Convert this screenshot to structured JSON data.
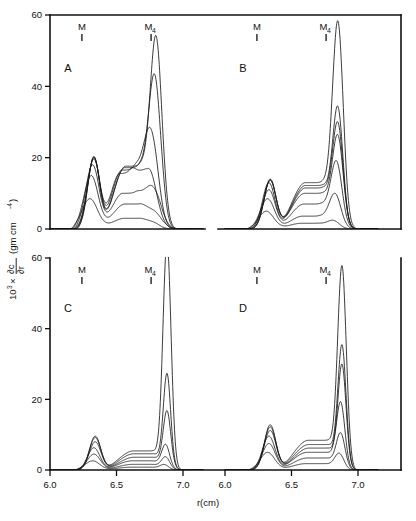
{
  "figure": {
    "xlabel": "r(cm)",
    "ylabel_prefix": "10",
    "ylabel_exponent": "3",
    "ylabel_times": "×",
    "ylabel_frac_num": "∂c",
    "ylabel_frac_den": "∂r",
    "ylabel_units_open": "(gm cm",
    "ylabel_units_exp": "-4",
    "ylabel_units_close": ")",
    "x_ticks": [
      "6.0",
      "6.5",
      "7.0"
    ],
    "x_tick_values": [
      6.0,
      6.5,
      7.0
    ],
    "y_ticks": [
      "0",
      "20",
      "40",
      "60"
    ],
    "y_tick_values": [
      0,
      20,
      40,
      60
    ],
    "marker_m_label": "M",
    "marker_m4_label": "M",
    "marker_m4_sub": "4",
    "marker_m_x": 6.24,
    "marker_m4_x": 6.76
  },
  "chart_data": {
    "type": "line",
    "title": "",
    "xlabel": "r(cm)",
    "ylabel": "10^3 × ∂c/∂r (gm cm^-4)",
    "xlim": [
      6.0,
      7.15
    ],
    "ylim": [
      0,
      60
    ],
    "grid": false,
    "legend": "none",
    "annotations": [
      {
        "text": "M",
        "x": 6.24,
        "note": "monomer marker"
      },
      {
        "text": "M4",
        "x": 6.76,
        "note": "tetramer marker"
      }
    ],
    "panels": [
      {
        "label": "A",
        "ylim": [
          0,
          60
        ],
        "series": [
          {
            "name": "A1",
            "peak_m": 8.5,
            "peak_m4": 0.9,
            "valley": 3.0,
            "m_x": 6.3,
            "m4_x": 6.8,
            "edge_left": 6.14,
            "edge_right": 6.92,
            "broad": 0.06,
            "broad4": 0.045
          },
          {
            "name": "A2",
            "peak_m": 15.0,
            "peak_m4": 3.0,
            "valley": 7.0,
            "m_x": 6.31,
            "m4_x": 6.81,
            "edge_left": 6.15,
            "edge_right": 6.98,
            "broad": 0.055,
            "broad4": 0.05
          },
          {
            "name": "A3",
            "peak_m": 18.0,
            "peak_m4": 11.0,
            "valley": 10.0,
            "m_x": 6.32,
            "m4_x": 6.78,
            "edge_left": 6.16,
            "edge_right": 7.02,
            "broad": 0.052,
            "broad4": 0.055
          },
          {
            "name": "A4",
            "peak_m": 19.6,
            "peak_m4": 17.0,
            "valley": 15.5,
            "m_x": 6.33,
            "m4_x": 6.74,
            "edge_left": 6.16,
            "edge_right": 7.04,
            "broad": 0.05,
            "broad4": 0.06
          },
          {
            "name": "A5",
            "peak_m": 20.0,
            "peak_m4": 27.0,
            "valley": 16.5,
            "m_x": 6.33,
            "m4_x": 6.76,
            "edge_left": 6.17,
            "edge_right": 7.06,
            "broad": 0.048,
            "broad4": 0.052
          },
          {
            "name": "A6",
            "peak_m": 20.2,
            "peak_m4": 40.0,
            "valley": 17.2,
            "m_x": 6.33,
            "m4_x": 6.79,
            "edge_left": 6.17,
            "edge_right": 7.08,
            "broad": 0.046,
            "broad4": 0.046
          },
          {
            "name": "A7",
            "peak_m": 20.3,
            "peak_m4": 50.0,
            "valley": 17.6,
            "m_x": 6.33,
            "m4_x": 6.8,
            "edge_left": 6.18,
            "edge_right": 7.1,
            "broad": 0.045,
            "broad4": 0.044
          }
        ]
      },
      {
        "label": "B",
        "ylim": [
          0,
          60
        ],
        "series": [
          {
            "name": "B1",
            "peak_m": 5.0,
            "peak_m4": 2.0,
            "valley": 1.6,
            "m_x": 6.31,
            "m4_x": 6.82,
            "edge_left": 6.14,
            "edge_right": 6.96,
            "broad": 0.058,
            "broad4": 0.045
          },
          {
            "name": "B2",
            "peak_m": 8.5,
            "peak_m4": 9.0,
            "valley": 3.6,
            "m_x": 6.32,
            "m4_x": 6.83,
            "edge_left": 6.15,
            "edge_right": 7.02,
            "broad": 0.054,
            "broad4": 0.044
          },
          {
            "name": "B3",
            "peak_m": 11.0,
            "peak_m4": 17.0,
            "valley": 7.0,
            "m_x": 6.33,
            "m4_x": 6.84,
            "edge_left": 6.16,
            "edge_right": 7.05,
            "broad": 0.05,
            "broad4": 0.042
          },
          {
            "name": "B4",
            "peak_m": 13.0,
            "peak_m4": 23.0,
            "valley": 10.0,
            "m_x": 6.33,
            "m4_x": 6.85,
            "edge_left": 6.16,
            "edge_right": 7.07,
            "broad": 0.048,
            "broad4": 0.04
          },
          {
            "name": "B5",
            "peak_m": 13.6,
            "peak_m4": 26.0,
            "valley": 11.5,
            "m_x": 6.34,
            "m4_x": 6.85,
            "edge_left": 6.17,
            "edge_right": 7.08,
            "broad": 0.047,
            "broad4": 0.039
          },
          {
            "name": "B6",
            "peak_m": 14.0,
            "peak_m4": 30.0,
            "valley": 12.2,
            "m_x": 6.34,
            "m4_x": 6.85,
            "edge_left": 6.17,
            "edge_right": 7.09,
            "broad": 0.046,
            "broad4": 0.038
          },
          {
            "name": "B7",
            "peak_m": 13.8,
            "peak_m4": 54.0,
            "valley": 13.0,
            "m_x": 6.34,
            "m4_x": 6.85,
            "edge_left": 6.18,
            "edge_right": 7.1,
            "broad": 0.046,
            "broad4": 0.04
          }
        ]
      },
      {
        "label": "C",
        "ylim": [
          0,
          60
        ],
        "series": [
          {
            "name": "C1",
            "peak_m": 2.6,
            "peak_m4": 1.2,
            "valley": 0.8,
            "m_x": 6.32,
            "m4_x": 6.86,
            "edge_left": 6.16,
            "edge_right": 7.0,
            "broad": 0.055,
            "broad4": 0.032
          },
          {
            "name": "C2",
            "peak_m": 4.5,
            "peak_m4": 3.0,
            "valley": 1.6,
            "m_x": 6.33,
            "m4_x": 6.87,
            "edge_left": 6.17,
            "edge_right": 7.04,
            "broad": 0.05,
            "broad4": 0.03
          },
          {
            "name": "C3",
            "peak_m": 6.3,
            "peak_m4": 6.0,
            "valley": 2.6,
            "m_x": 6.33,
            "m4_x": 6.87,
            "edge_left": 6.17,
            "edge_right": 7.06,
            "broad": 0.047,
            "broad4": 0.029
          },
          {
            "name": "C4",
            "peak_m": 8.0,
            "peak_m4": 15.0,
            "valley": 3.6,
            "m_x": 6.34,
            "m4_x": 6.88,
            "edge_left": 6.18,
            "edge_right": 7.08,
            "broad": 0.045,
            "broad4": 0.028
          },
          {
            "name": "C5",
            "peak_m": 9.2,
            "peak_m4": 25.0,
            "valley": 4.6,
            "m_x": 6.34,
            "m4_x": 6.88,
            "edge_left": 6.18,
            "edge_right": 7.09,
            "broad": 0.044,
            "broad4": 0.027
          },
          {
            "name": "C6",
            "peak_m": 9.6,
            "peak_m4": 62.0,
            "valley": 5.4,
            "m_x": 6.34,
            "m4_x": 6.88,
            "edge_left": 6.18,
            "edge_right": 7.1,
            "broad": 0.043,
            "broad4": 0.03
          }
        ]
      },
      {
        "label": "D",
        "ylim": [
          0,
          60
        ],
        "series": [
          {
            "name": "D1",
            "peak_m": 5.0,
            "peak_m4": 4.0,
            "valley": 1.8,
            "m_x": 6.32,
            "m4_x": 6.86,
            "edge_left": 6.15,
            "edge_right": 7.02,
            "broad": 0.055,
            "broad4": 0.034
          },
          {
            "name": "D2",
            "peak_m": 7.5,
            "peak_m4": 9.0,
            "valley": 3.4,
            "m_x": 6.33,
            "m4_x": 6.87,
            "edge_left": 6.16,
            "edge_right": 7.05,
            "broad": 0.05,
            "broad4": 0.032
          },
          {
            "name": "D3",
            "peak_m": 9.6,
            "peak_m4": 17.0,
            "valley": 5.0,
            "m_x": 6.33,
            "m4_x": 6.87,
            "edge_left": 6.17,
            "edge_right": 7.07,
            "broad": 0.048,
            "broad4": 0.031
          },
          {
            "name": "D4",
            "peak_m": 11.2,
            "peak_m4": 27.0,
            "valley": 6.2,
            "m_x": 6.34,
            "m4_x": 6.88,
            "edge_left": 6.17,
            "edge_right": 7.08,
            "broad": 0.046,
            "broad4": 0.03
          },
          {
            "name": "D5",
            "peak_m": 12.2,
            "peak_m4": 32.0,
            "valley": 7.2,
            "m_x": 6.34,
            "m4_x": 6.88,
            "edge_left": 6.18,
            "edge_right": 7.09,
            "broad": 0.045,
            "broad4": 0.03
          },
          {
            "name": "D6",
            "peak_m": 12.8,
            "peak_m4": 54.0,
            "valley": 8.4,
            "m_x": 6.34,
            "m4_x": 6.88,
            "edge_left": 6.18,
            "edge_right": 7.1,
            "broad": 0.044,
            "broad4": 0.032
          }
        ]
      }
    ]
  }
}
